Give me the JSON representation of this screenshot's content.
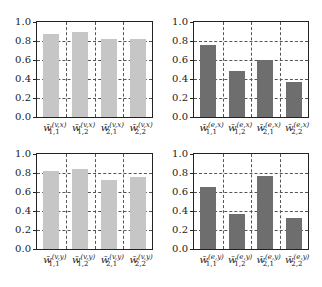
{
  "colors": {
    "light_bar": "#c6c6c6",
    "dark_bar": "#6e6e6e",
    "axis": "#222222",
    "grid": "#555555"
  },
  "chart_data": [
    {
      "type": "bar",
      "position": "top-left",
      "categories": [
        "w̄(v,x) 1,1",
        "w̄(v,x) 1,2",
        "w̄(v,x) 2,1",
        "w̄(v,x) 2,2"
      ],
      "labels": [
        {
          "sup": "(v,x)",
          "sub": "1,1"
        },
        {
          "sup": "(v,x)",
          "sub": "1,2"
        },
        {
          "sup": "(v,x)",
          "sub": "2,1"
        },
        {
          "sup": "(v,x)",
          "sub": "2,2"
        }
      ],
      "values": [
        0.87,
        0.9,
        0.82,
        0.82
      ],
      "color": "#c6c6c6",
      "yticks": [
        "0.0",
        "0.2",
        "0.4",
        "0.6",
        "0.8",
        "1.0"
      ],
      "ylim": [
        0,
        1.0
      ],
      "grid": true
    },
    {
      "type": "bar",
      "position": "top-right",
      "categories": [
        "w̄(e,x) 1,1",
        "w̄(e,x) 1,2",
        "w̄(e,x) 2,1",
        "w̄(e,x) 2,2"
      ],
      "labels": [
        {
          "sup": "(e,x)",
          "sub": "1,1"
        },
        {
          "sup": "(e,x)",
          "sub": "1,2"
        },
        {
          "sup": "(e,x)",
          "sub": "2,1"
        },
        {
          "sup": "(e,x)",
          "sub": "2,2"
        }
      ],
      "values": [
        0.76,
        0.48,
        0.6,
        0.37
      ],
      "color": "#6e6e6e",
      "yticks": [
        "0.0",
        "0.2",
        "0.4",
        "0.6",
        "0.8",
        "1.0"
      ],
      "ylim": [
        0,
        1.0
      ],
      "grid": true
    },
    {
      "type": "bar",
      "position": "bottom-left",
      "categories": [
        "w̄(v,y) 1,1",
        "w̄(v,y) 1,2",
        "w̄(v,y) 2,1",
        "w̄(v,y) 2,2"
      ],
      "labels": [
        {
          "sup": "(v,y)",
          "sub": "1,1"
        },
        {
          "sup": "(v,y)",
          "sub": "1,2"
        },
        {
          "sup": "(v,y)",
          "sub": "2,1"
        },
        {
          "sup": "(v,y)",
          "sub": "2,2"
        }
      ],
      "values": [
        0.82,
        0.84,
        0.73,
        0.76
      ],
      "color": "#c6c6c6",
      "yticks": [
        "0.0",
        "0.2",
        "0.4",
        "0.6",
        "0.8",
        "1.0"
      ],
      "ylim": [
        0,
        1.0
      ],
      "grid": true
    },
    {
      "type": "bar",
      "position": "bottom-right",
      "categories": [
        "w̄(e,y) 1,1",
        "w̄(e,y) 1,2",
        "w̄(e,y) 2,1",
        "w̄(e,y) 2,2"
      ],
      "labels": [
        {
          "sup": "(e,y)",
          "sub": "1,1"
        },
        {
          "sup": "(e,y)",
          "sub": "1,2"
        },
        {
          "sup": "(e,y)",
          "sub": "2,1"
        },
        {
          "sup": "(e,y)",
          "sub": "2,2"
        }
      ],
      "values": [
        0.65,
        0.37,
        0.77,
        0.33
      ],
      "color": "#6e6e6e",
      "yticks": [
        "0.0",
        "0.2",
        "0.4",
        "0.6",
        "0.8",
        "1.0"
      ],
      "ylim": [
        0,
        1.0
      ],
      "grid": true
    }
  ],
  "label_base": "w̄"
}
